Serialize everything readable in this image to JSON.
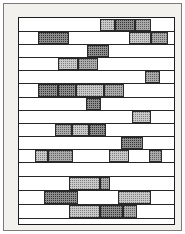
{
  "figure": {
    "kind": "gantt-schedule-chart",
    "title": "",
    "caption": "",
    "page_background": "#f2f1ee",
    "plot_background": "#ffffff",
    "border_color": "#1c1c1c"
  },
  "legend": {
    "tones": [
      {
        "key": "light",
        "label": "",
        "color": "#c9c9c9"
      },
      {
        "key": "mid",
        "label": "",
        "color": "#ababab"
      },
      {
        "key": "dark",
        "label": "",
        "color": "#8d8d8d"
      }
    ]
  },
  "chart_data": {
    "type": "bar",
    "title": "",
    "xlabel": "",
    "ylabel": "",
    "xlim": [
      0,
      100
    ],
    "ylim": [
      0,
      15
    ],
    "grid": false,
    "legend_position": "none",
    "categories": [
      "row-1",
      "row-2",
      "row-3",
      "row-4",
      "row-5",
      "row-6",
      "row-7",
      "row-8",
      "row-9",
      "row-10",
      "row-11",
      "row-12",
      "row-13",
      "row-14",
      "row-15"
    ],
    "rows": [
      {
        "index": 1,
        "top": 1,
        "height": 13,
        "blocks": [
          {
            "start": 52,
            "end": 62,
            "tone": "light"
          },
          {
            "start": 62,
            "end": 75,
            "tone": "dark"
          },
          {
            "start": 75,
            "end": 85,
            "tone": "mid"
          }
        ]
      },
      {
        "index": 2,
        "top": 14,
        "height": 13,
        "blocks": [
          {
            "start": 12,
            "end": 32,
            "tone": "dark"
          },
          {
            "start": 71,
            "end": 85,
            "tone": "light"
          },
          {
            "start": 85,
            "end": 96,
            "tone": "mid"
          }
        ]
      },
      {
        "index": 3,
        "top": 27,
        "height": 13,
        "blocks": [
          {
            "start": 44,
            "end": 58,
            "tone": "dark"
          }
        ]
      },
      {
        "index": 4,
        "top": 40,
        "height": 13,
        "blocks": [
          {
            "start": 25,
            "end": 38,
            "tone": "light"
          },
          {
            "start": 38,
            "end": 51,
            "tone": "mid"
          }
        ]
      },
      {
        "index": 5,
        "top": 53,
        "height": 13,
        "blocks": [
          {
            "start": 81,
            "end": 91,
            "tone": "mid"
          }
        ]
      },
      {
        "index": 6,
        "top": 66,
        "height": 14,
        "blocks": [
          {
            "start": 12,
            "end": 25,
            "tone": "dark"
          },
          {
            "start": 25,
            "end": 37,
            "tone": "dark"
          },
          {
            "start": 37,
            "end": 55,
            "tone": "light"
          },
          {
            "start": 55,
            "end": 68,
            "tone": "mid"
          }
        ]
      },
      {
        "index": 7,
        "top": 80,
        "height": 13,
        "blocks": [
          {
            "start": 43,
            "end": 53,
            "tone": "dark"
          }
        ]
      },
      {
        "index": 8,
        "top": 93,
        "height": 13,
        "blocks": [
          {
            "start": 73,
            "end": 85,
            "tone": "light"
          }
        ]
      },
      {
        "index": 9,
        "top": 106,
        "height": 13,
        "blocks": [
          {
            "start": 23,
            "end": 34,
            "tone": "mid"
          },
          {
            "start": 34,
            "end": 45,
            "tone": "light"
          },
          {
            "start": 45,
            "end": 56,
            "tone": "dark"
          }
        ]
      },
      {
        "index": 10,
        "top": 119,
        "height": 13,
        "blocks": [
          {
            "start": 66,
            "end": 80,
            "tone": "dark"
          }
        ]
      },
      {
        "index": 11,
        "top": 132,
        "height": 13,
        "blocks": [
          {
            "start": 10,
            "end": 19,
            "tone": "light"
          },
          {
            "start": 19,
            "end": 35,
            "tone": "mid"
          },
          {
            "start": 58,
            "end": 71,
            "tone": "light"
          },
          {
            "start": 84,
            "end": 92,
            "tone": "mid"
          }
        ]
      },
      {
        "index": 12,
        "top": 145,
        "height": 14,
        "blocks": []
      },
      {
        "index": 13,
        "top": 159,
        "height": 14,
        "blocks": [
          {
            "start": 32,
            "end": 52,
            "tone": "light"
          },
          {
            "start": 52,
            "end": 59,
            "tone": "mid"
          }
        ]
      },
      {
        "index": 14,
        "top": 173,
        "height": 14,
        "blocks": [
          {
            "start": 16,
            "end": 38,
            "tone": "dark"
          },
          {
            "start": 64,
            "end": 85,
            "tone": "light"
          }
        ]
      },
      {
        "index": 15,
        "top": 187,
        "height": 14,
        "blocks": [
          {
            "start": 32,
            "end": 52,
            "tone": "light"
          },
          {
            "start": 52,
            "end": 67,
            "tone": "dark"
          },
          {
            "start": 67,
            "end": 76,
            "tone": "mid"
          }
        ]
      }
    ]
  }
}
